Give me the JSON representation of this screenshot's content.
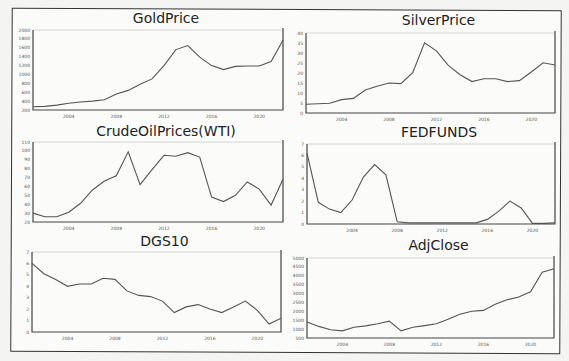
{
  "chart_data": [
    {
      "type": "line",
      "title": "GoldPrice",
      "x": [
        2001,
        2002,
        2003,
        2004,
        2005,
        2006,
        2007,
        2008,
        2009,
        2010,
        2011,
        2012,
        2013,
        2014,
        2015,
        2016,
        2017,
        2018,
        2019,
        2020,
        2021,
        2022
      ],
      "values": [
        271,
        280,
        310,
        350,
        380,
        400,
        430,
        560,
        640,
        780,
        900,
        1200,
        1560,
        1650,
        1390,
        1200,
        1110,
        1180,
        1190,
        1190,
        1290,
        1770
      ],
      "yticks": [
        200,
        400,
        600,
        800,
        1000,
        1200,
        1400,
        1600,
        1800,
        2000
      ],
      "xticks": [
        2004,
        2008,
        2012,
        2016,
        2020
      ],
      "ylim": [
        200,
        2000
      ],
      "xlabel": "",
      "ylabel": "",
      "grid": false,
      "legend": null
    },
    {
      "type": "line",
      "title": "SilverPrice",
      "x": [
        2001,
        2002,
        2003,
        2004,
        2005,
        2006,
        2007,
        2008,
        2009,
        2010,
        2011,
        2012,
        2013,
        2014,
        2015,
        2016,
        2017,
        2018,
        2019,
        2020,
        2021,
        2022
      ],
      "values": [
        4.4,
        4.6,
        4.9,
        6.7,
        7.3,
        11.5,
        13.4,
        15,
        14.7,
        20.2,
        35.1,
        31.1,
        23.8,
        19.1,
        15.7,
        17.1,
        17.1,
        15.7,
        16.2,
        20.5,
        25.1,
        24
      ],
      "yticks": [
        0,
        5,
        10,
        15,
        20,
        25,
        30,
        35,
        40
      ],
      "xticks": [
        2004,
        2008,
        2012,
        2016,
        2020
      ],
      "ylim": [
        0,
        40
      ],
      "xlabel": "",
      "ylabel": "",
      "grid": false,
      "legend": null
    },
    {
      "type": "line",
      "title": "CrudeOilPrices(WTI)",
      "x": [
        2001,
        2002,
        2003,
        2004,
        2005,
        2006,
        2007,
        2008,
        2009,
        2010,
        2011,
        2012,
        2013,
        2014,
        2015,
        2016,
        2017,
        2018,
        2019,
        2020,
        2021,
        2022
      ],
      "values": [
        30,
        26,
        26,
        31,
        41,
        56,
        66,
        72,
        99,
        62,
        79,
        95,
        94,
        98,
        93,
        48,
        43,
        50,
        65,
        57,
        39,
        68,
        94
      ],
      "yticks": [
        20,
        30,
        40,
        50,
        60,
        70,
        80,
        90,
        100,
        110
      ],
      "xticks": [
        2004,
        2008,
        2012,
        2016,
        2020
      ],
      "ylim": [
        20,
        110
      ],
      "xlabel": "",
      "ylabel": "",
      "grid": false,
      "legend": null
    },
    {
      "type": "line",
      "title": "FEDFUNDS",
      "x": [
        2000,
        2001,
        2002,
        2003,
        2004,
        2005,
        2006,
        2007,
        2008,
        2009,
        2010,
        2011,
        2012,
        2013,
        2014,
        2015,
        2016,
        2017,
        2018,
        2019,
        2020,
        2021,
        2022
      ],
      "values": [
        6.2,
        1.9,
        1.3,
        1.0,
        2.1,
        4.1,
        5.2,
        4.3,
        0.2,
        0.1,
        0.1,
        0.1,
        0.1,
        0.1,
        0.1,
        0.1,
        0.4,
        1.1,
        2.0,
        1.4,
        0.05,
        0.05,
        0.1
      ],
      "yticks": [
        0,
        1,
        2,
        3,
        4,
        5,
        6,
        7
      ],
      "xticks": [
        2004,
        2008,
        2012,
        2016,
        2020
      ],
      "ylim": [
        0,
        7
      ],
      "xlabel": "",
      "ylabel": "",
      "grid": false,
      "legend": null
    },
    {
      "type": "line",
      "title": "DGS10",
      "x": [
        2001,
        2002,
        2003,
        2004,
        2005,
        2006,
        2007,
        2008,
        2009,
        2010,
        2011,
        2012,
        2013,
        2014,
        2015,
        2016,
        2017,
        2018,
        2019,
        2020,
        2021,
        2022
      ],
      "values": [
        6.0,
        5.1,
        4.6,
        4.0,
        4.2,
        4.2,
        4.7,
        4.6,
        3.6,
        3.2,
        3.1,
        2.7,
        1.7,
        2.2,
        2.4,
        2.0,
        1.7,
        2.2,
        2.7,
        1.9,
        0.7,
        1.2,
        1.5
      ],
      "yticks": [
        0,
        1,
        2,
        3,
        4,
        5,
        6,
        7
      ],
      "xticks": [
        2004,
        2008,
        2012,
        2016,
        2020
      ],
      "ylim": [
        0,
        7
      ],
      "xlabel": "",
      "ylabel": "",
      "grid": false,
      "legend": null
    },
    {
      "type": "line",
      "title": "AdjClose",
      "x": [
        2001,
        2002,
        2003,
        2004,
        2005,
        2006,
        2007,
        2008,
        2009,
        2010,
        2011,
        2012,
        2013,
        2014,
        2015,
        2016,
        2017,
        2018,
        2019,
        2020,
        2021,
        2022
      ],
      "values": [
        1400,
        1150,
        960,
        900,
        1100,
        1180,
        1300,
        1450,
        900,
        1100,
        1200,
        1300,
        1560,
        1840,
        2000,
        2050,
        2400,
        2650,
        2800,
        3100,
        4200,
        4400
      ],
      "yticks": [
        500,
        1000,
        1500,
        2000,
        2500,
        3000,
        3500,
        4000,
        4500,
        5000
      ],
      "xticks": [
        2004,
        2008,
        2012,
        2016,
        2020
      ],
      "ylim": [
        500,
        5000
      ],
      "xlabel": "",
      "ylabel": "",
      "grid": false,
      "legend": null
    }
  ],
  "panels": [
    {
      "title": "GoldPrice"
    },
    {
      "title": "SilverPrice"
    },
    {
      "title": "CrudeOilPrices(WTI)"
    },
    {
      "title": "FEDFUNDS"
    },
    {
      "title": "DGS10"
    },
    {
      "title": "AdjClose"
    }
  ]
}
